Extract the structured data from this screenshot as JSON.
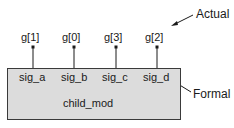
{
  "diagram": {
    "module": {
      "name": "child_mod",
      "fill": "#dcdcdc",
      "stroke": "#3a3a3a"
    },
    "ports": [
      {
        "actual": "g[1]",
        "formal": "sig_a"
      },
      {
        "actual": "g[0]",
        "formal": "sig_b"
      },
      {
        "actual": "g[3]",
        "formal": "sig_c"
      },
      {
        "actual": "g[2]",
        "formal": "sig_d"
      }
    ],
    "annotations": {
      "actual": "Actual",
      "formal": "Formal"
    }
  }
}
